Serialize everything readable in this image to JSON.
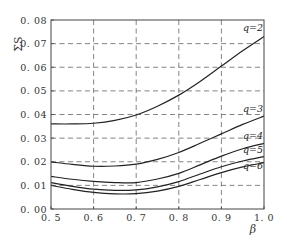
{
  "chart_data": {
    "type": "line",
    "title": "",
    "xlabel": "β",
    "ylabel": "ΣS",
    "xlim": [
      0.5,
      1.0
    ],
    "ylim": [
      0.0,
      0.08
    ],
    "grid": true,
    "x_ticks": [
      0.5,
      0.6,
      0.7,
      0.8,
      0.9,
      1.0
    ],
    "x_tick_labels": [
      "0. 5",
      "0. 6",
      "0. 7",
      "0. 8",
      "0. 9",
      "1. 0"
    ],
    "y_ticks": [
      0.0,
      0.01,
      0.02,
      0.03,
      0.04,
      0.05,
      0.06,
      0.07,
      0.08
    ],
    "y_tick_labels": [
      "0. 00",
      "0. 01",
      "0. 02",
      "0. 03",
      "0. 04",
      "0. 05",
      "0. 06",
      "0. 07",
      "0. 08"
    ],
    "x": [
      0.5,
      0.55,
      0.6,
      0.65,
      0.7,
      0.75,
      0.8,
      0.85,
      0.9,
      0.95,
      1.0
    ],
    "series": [
      {
        "name": "q=2",
        "label": "q=2",
        "values": [
          0.036,
          0.036,
          0.0363,
          0.0375,
          0.0398,
          0.0435,
          0.0482,
          0.054,
          0.0605,
          0.067,
          0.073
        ]
      },
      {
        "name": "q=3",
        "label": "q=3",
        "values": [
          0.0199,
          0.0189,
          0.0181,
          0.0182,
          0.019,
          0.021,
          0.0239,
          0.0278,
          0.0318,
          0.0358,
          0.0393
        ]
      },
      {
        "name": "q=4",
        "label": "q=4",
        "values": [
          0.0138,
          0.0126,
          0.0117,
          0.0112,
          0.0112,
          0.0127,
          0.0151,
          0.0187,
          0.0224,
          0.0255,
          0.0278
        ]
      },
      {
        "name": "q=5",
        "label": "q=5",
        "values": [
          0.0112,
          0.0096,
          0.0084,
          0.0079,
          0.0081,
          0.0094,
          0.0116,
          0.0148,
          0.0179,
          0.0203,
          0.0222
        ]
      },
      {
        "name": "q=6",
        "label": "q=6",
        "values": [
          0.01,
          0.0083,
          0.007,
          0.0064,
          0.0065,
          0.0076,
          0.0096,
          0.0125,
          0.0154,
          0.0178,
          0.0196
        ]
      }
    ],
    "legend": "inline-right"
  }
}
